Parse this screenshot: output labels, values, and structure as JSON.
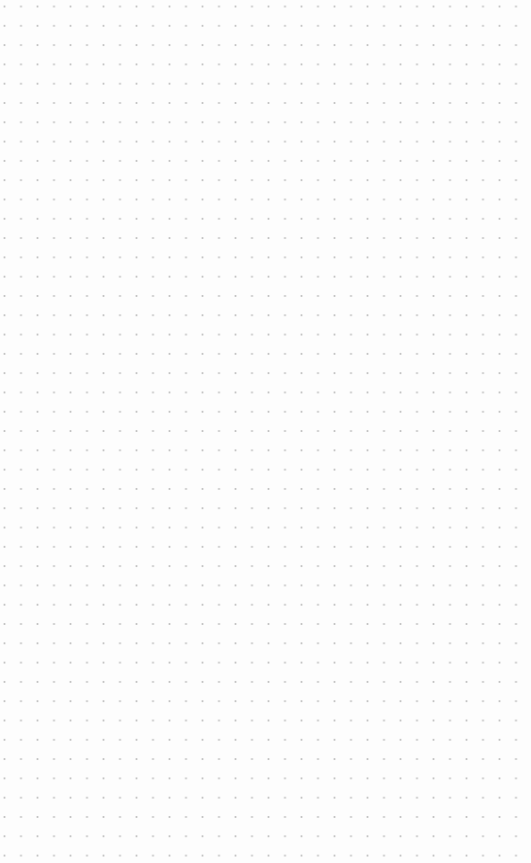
{
  "canvas": {
    "type": "dot-grid",
    "background_color": "#fdfdfd",
    "dot_color": "#c4c4c4",
    "dot_spacing_x": 16.5,
    "dot_spacing_y": 19.3
  }
}
